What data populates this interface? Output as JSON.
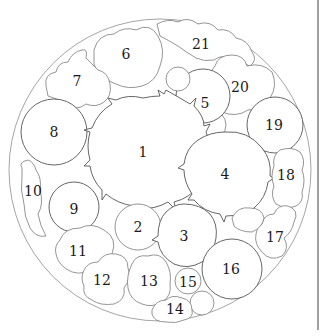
{
  "diagram": {
    "type": "circular planting plan",
    "outer_circle": {
      "cx": 160,
      "cy": 170,
      "r": 150
    },
    "regions": [
      {
        "id": "1",
        "label": "1",
        "x": 143,
        "y": 152
      },
      {
        "id": "2",
        "label": "2",
        "x": 138,
        "y": 227
      },
      {
        "id": "3",
        "label": "3",
        "x": 184,
        "y": 236
      },
      {
        "id": "4",
        "label": "4",
        "x": 225,
        "y": 174
      },
      {
        "id": "5",
        "label": "5",
        "x": 205,
        "y": 103
      },
      {
        "id": "6",
        "label": "6",
        "x": 126,
        "y": 54
      },
      {
        "id": "7",
        "label": "7",
        "x": 77,
        "y": 81
      },
      {
        "id": "8",
        "label": "8",
        "x": 54,
        "y": 132
      },
      {
        "id": "9",
        "label": "9",
        "x": 74,
        "y": 209
      },
      {
        "id": "10",
        "label": "10",
        "x": 33,
        "y": 191
      },
      {
        "id": "11",
        "label": "11",
        "x": 78,
        "y": 251
      },
      {
        "id": "12",
        "label": "12",
        "x": 102,
        "y": 280
      },
      {
        "id": "13",
        "label": "13",
        "x": 149,
        "y": 281
      },
      {
        "id": "14",
        "label": "14",
        "x": 175,
        "y": 309
      },
      {
        "id": "15",
        "label": "15",
        "x": 188,
        "y": 282
      },
      {
        "id": "16",
        "label": "16",
        "x": 231,
        "y": 269
      },
      {
        "id": "17",
        "label": "17",
        "x": 275,
        "y": 237
      },
      {
        "id": "18",
        "label": "18",
        "x": 286,
        "y": 175
      },
      {
        "id": "19",
        "label": "19",
        "x": 274,
        "y": 125
      },
      {
        "id": "20",
        "label": "20",
        "x": 240,
        "y": 87
      },
      {
        "id": "21",
        "label": "21",
        "x": 201,
        "y": 44
      }
    ],
    "colors": {
      "stroke": "#555555",
      "outer_stroke": "#9a9a9a",
      "background": "#ffffff",
      "text": "#1a1a1a"
    }
  }
}
